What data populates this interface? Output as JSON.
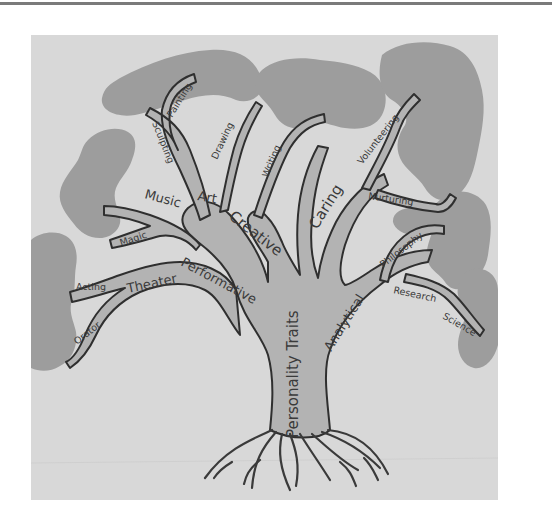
{
  "diagram": {
    "type": "trait-tree",
    "colors": {
      "panel_background": "#d8d8d8",
      "canopy": "#9d9d9d",
      "branch_fill": "#b3b3b3",
      "outline": "#2f2f2f"
    },
    "trunk": {
      "label": "Personality Traits"
    },
    "branches": [
      {
        "label": "Performative",
        "children": [
          {
            "label": "Theater",
            "children": [
              {
                "label": "Acting"
              },
              {
                "label": "Orator"
              }
            ]
          },
          {
            "label": "Magic"
          },
          {
            "label": "Music"
          }
        ]
      },
      {
        "label": "Creative",
        "children": [
          {
            "label": "Art",
            "children": [
              {
                "label": "Sculpting"
              },
              {
                "label": "Painting"
              },
              {
                "label": "Drawing"
              }
            ]
          },
          {
            "label": "Writing"
          }
        ]
      },
      {
        "label": "Caring",
        "children": [
          {
            "label": "Volunteering"
          },
          {
            "label": "Nurturing"
          }
        ]
      },
      {
        "label": "Analytical",
        "children": [
          {
            "label": "Philosophy"
          },
          {
            "label": "Research"
          },
          {
            "label": "Science"
          }
        ]
      }
    ]
  },
  "labels": {
    "trunk": "Personality Traits",
    "performative": "Performative",
    "theater": "Theater",
    "acting": "Acting",
    "orator": "Orator",
    "magic": "Magic",
    "music": "Music",
    "creative": "Creative",
    "art": "Art",
    "sculpting": "Sculpting",
    "painting": "Painting",
    "drawing": "Drawing",
    "writing": "Writing",
    "caring": "Caring",
    "volunteering": "Volunteering",
    "nurturing": "Nurturing",
    "analytical": "Analytical",
    "philosophy": "Philosophy",
    "research": "Research",
    "science": "Science"
  }
}
